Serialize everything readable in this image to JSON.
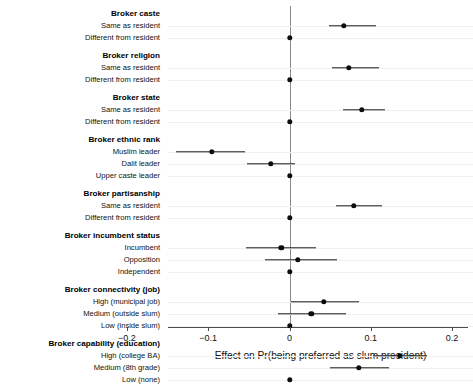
{
  "chart_data": {
    "type": "scatter",
    "title": "",
    "xlabel": "Effect on Pr(being preferred as slum president)",
    "ylabel": "",
    "xlim": [
      -0.2,
      0.2
    ],
    "xticks": [
      -0.2,
      -0.1,
      0,
      0.1,
      0.2
    ],
    "xticklabels": [
      "-0.2",
      "-0.1",
      "0",
      "0.1",
      "0.2"
    ],
    "grid": true,
    "legend": null,
    "reference_line": 0,
    "error_bar_style": "horizontal-confidence-interval",
    "groups": [
      {
        "name": "Broker caste",
        "rows": [
          {
            "label": "Same as resident",
            "estimate": 0.067,
            "ci_low": 0.049,
            "ci_high": 0.106,
            "reference": false
          },
          {
            "label": "Different from resident",
            "estimate": 0.0,
            "ci_low": 0.0,
            "ci_high": 0.0,
            "reference": true
          }
        ]
      },
      {
        "name": "Broker religion",
        "rows": [
          {
            "label": "Same as resident",
            "estimate": 0.073,
            "ci_low": 0.052,
            "ci_high": 0.11,
            "reference": false
          },
          {
            "label": "Different from resident",
            "estimate": 0.0,
            "ci_low": 0.0,
            "ci_high": 0.0,
            "reference": true
          }
        ]
      },
      {
        "name": "Broker state",
        "rows": [
          {
            "label": "Same as resident",
            "estimate": 0.089,
            "ci_low": 0.066,
            "ci_high": 0.117,
            "reference": false
          },
          {
            "label": "Different from resident",
            "estimate": 0.0,
            "ci_low": 0.0,
            "ci_high": 0.0,
            "reference": true
          }
        ]
      },
      {
        "name": "Broker ethnic rank",
        "rows": [
          {
            "label": "Muslim leader",
            "estimate": -0.096,
            "ci_low": -0.14,
            "ci_high": -0.055,
            "reference": false
          },
          {
            "label": "Dalit leader",
            "estimate": -0.023,
            "ci_low": -0.052,
            "ci_high": 0.007,
            "reference": false
          },
          {
            "label": "Upper caste leader",
            "estimate": 0.0,
            "ci_low": 0.0,
            "ci_high": 0.0,
            "reference": true
          }
        ]
      },
      {
        "name": "Broker partisanship",
        "rows": [
          {
            "label": "Same as resident",
            "estimate": 0.079,
            "ci_low": 0.057,
            "ci_high": 0.114,
            "reference": false
          },
          {
            "label": "Different from resident",
            "estimate": 0.0,
            "ci_low": 0.0,
            "ci_high": 0.0,
            "reference": true
          }
        ]
      },
      {
        "name": "Broker incumbent status",
        "rows": [
          {
            "label": "Incumbent",
            "estimate": -0.01,
            "ci_low": -0.053,
            "ci_high": 0.033,
            "reference": false
          },
          {
            "label": "Opposition",
            "estimate": 0.01,
            "ci_low": -0.03,
            "ci_high": 0.058,
            "reference": false
          },
          {
            "label": "Independent",
            "estimate": 0.0,
            "ci_low": 0.0,
            "ci_high": 0.0,
            "reference": true
          }
        ]
      },
      {
        "name": "Broker connectivity (job)",
        "rows": [
          {
            "label": "High (municipal job)",
            "estimate": 0.042,
            "ci_low": 0.002,
            "ci_high": 0.086,
            "reference": false
          },
          {
            "label": "Medium (outside slum)",
            "estimate": 0.027,
            "ci_low": -0.014,
            "ci_high": 0.07,
            "reference": false
          },
          {
            "label": "Low (inside slum)",
            "estimate": 0.0,
            "ci_low": 0.0,
            "ci_high": 0.0,
            "reference": true
          }
        ]
      },
      {
        "name": "Broker capability (education)",
        "rows": [
          {
            "label": "High (college BA)",
            "estimate": 0.136,
            "ci_low": 0.103,
            "ci_high": 0.169,
            "reference": false
          },
          {
            "label": "Medium (8th grade)",
            "estimate": 0.085,
            "ci_low": 0.05,
            "ci_high": 0.122,
            "reference": false
          },
          {
            "label": "Low (none)",
            "estimate": 0.0,
            "ci_low": 0.0,
            "ci_high": 0.0,
            "reference": true
          }
        ]
      }
    ]
  },
  "colors": {
    "point": "#0d0d0d",
    "ci": "#1a1a1a",
    "grid": "#f0f0f0",
    "axis": "#4d4d4d",
    "zero_line": "#8a8a8a",
    "background": "#ffffff"
  }
}
